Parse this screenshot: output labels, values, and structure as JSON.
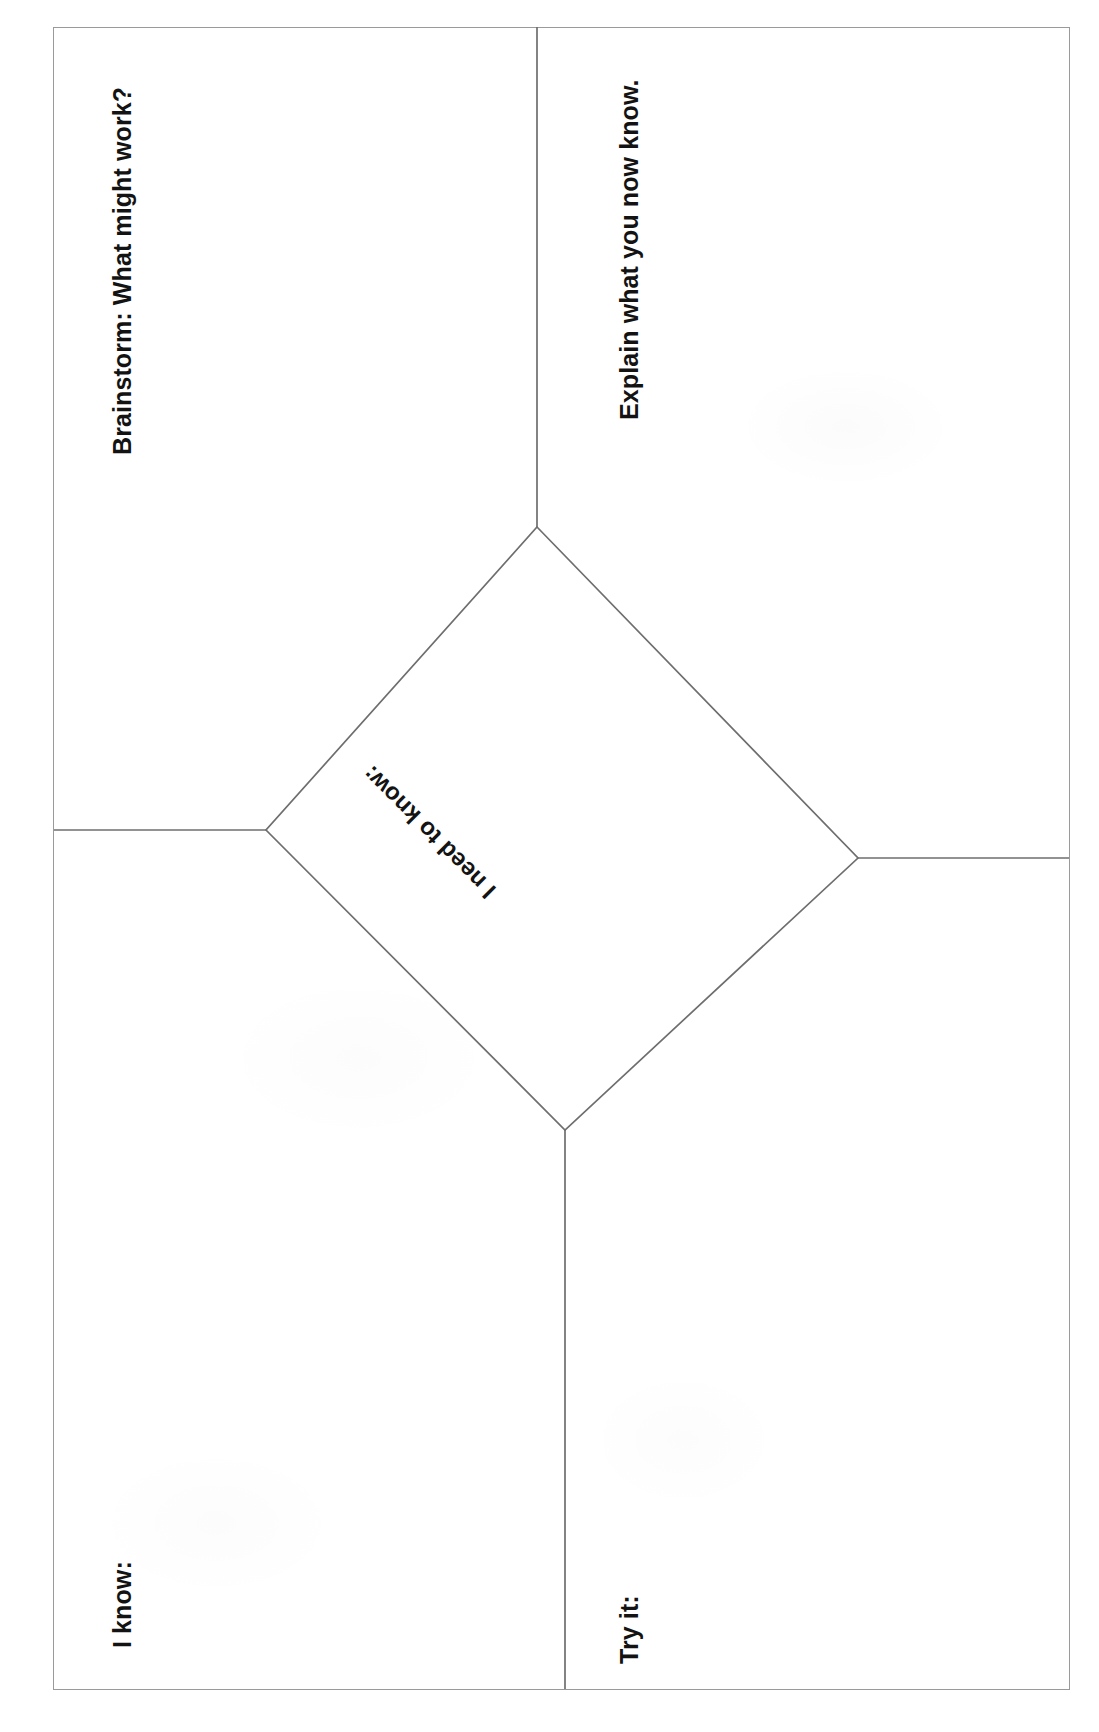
{
  "document": {
    "type": "graphic-organizer-worksheet",
    "orientation": "rotated-90-clockwise",
    "background_color": "#ffffff",
    "border_color": "#9a9a9a",
    "text_color": "#131313"
  },
  "center": {
    "shape": "diamond",
    "label": "I need to know:"
  },
  "quadrants": [
    {
      "id": "brainstorm",
      "label": "Brainstorm: What might work?",
      "position": "top-left"
    },
    {
      "id": "explain",
      "label": "Explain what you now know.",
      "position": "top-right"
    },
    {
      "id": "i-know",
      "label": "I know:",
      "position": "bottom-left"
    },
    {
      "id": "try-it",
      "label": "Try it:",
      "position": "bottom-right"
    }
  ]
}
